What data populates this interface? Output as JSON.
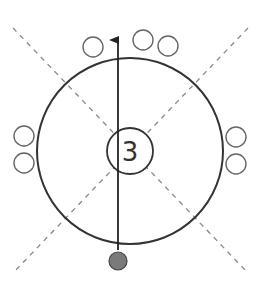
{
  "diagram": {
    "center_label": "3",
    "colors": {
      "stroke": "#333333",
      "dashed": "#888888",
      "player_circle": "#666666",
      "ball_fill": "#7a7a7a",
      "background": "#ffffff"
    },
    "outer_circle": {
      "cx": 130,
      "cy": 151,
      "r": 93
    },
    "center_circle": {
      "cx": 130,
      "cy": 151,
      "r": 23
    },
    "arrow": {
      "x": 118,
      "y_start": 250,
      "y_end": 40
    },
    "ball": {
      "cx": 118,
      "cy": 261,
      "r": 9
    },
    "players": [
      {
        "cx": 93,
        "cy": 47,
        "r": 10
      },
      {
        "cx": 143,
        "cy": 40,
        "r": 10
      },
      {
        "cx": 168,
        "cy": 46,
        "r": 10
      },
      {
        "cx": 24,
        "cy": 136,
        "r": 10
      },
      {
        "cx": 24,
        "cy": 163,
        "r": 10
      },
      {
        "cx": 236,
        "cy": 137,
        "r": 10
      },
      {
        "cx": 236,
        "cy": 164,
        "r": 10
      }
    ],
    "dashed_lines": [
      {
        "x1": 13,
        "y1": 28,
        "x2": 248,
        "y2": 273
      },
      {
        "x1": 248,
        "y1": 28,
        "x2": 13,
        "y2": 273
      }
    ]
  }
}
